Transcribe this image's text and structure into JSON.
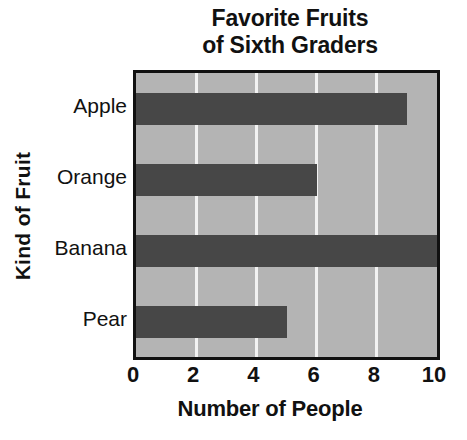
{
  "chart_data": {
    "type": "bar",
    "orientation": "horizontal",
    "title": "Favorite Fruits of Sixth Graders",
    "title_lines": [
      "Favorite Fruits",
      "of Sixth Graders"
    ],
    "categories": [
      "Apple",
      "Orange",
      "Banana",
      "Pear"
    ],
    "values": [
      9,
      6,
      10,
      5
    ],
    "xlabel": "Number of People",
    "ylabel": "Kind of Fruit",
    "xlim": [
      0,
      10
    ],
    "xticks": [
      0,
      2,
      4,
      6,
      8,
      10
    ],
    "xtick_labels": [
      "0",
      "2",
      "4",
      "6",
      "8",
      "10"
    ],
    "grid": "vertical-gridlines-at-2-4-6-8",
    "legend": "none",
    "colors": {
      "page_background": "#ffffff",
      "plot_background": "#b4b4b4",
      "bar_fill": "#474747",
      "gridline": "#f2f2f2",
      "axis_border": "#111111",
      "text": "#111111"
    }
  }
}
